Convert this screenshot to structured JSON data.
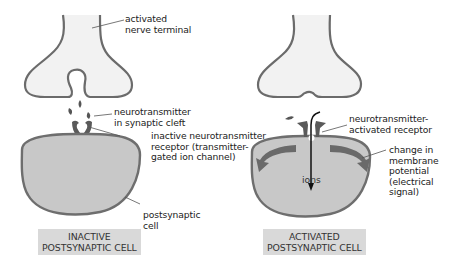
{
  "diagram": {
    "colors": {
      "terminal_fill": "#f2f2f2",
      "terminal_outline": "#6b6b6b",
      "cell_fill": "#c8c8c8",
      "membrane": "#6e6e6e",
      "neurotransmitter": "#555555",
      "receptor": "#5a5a5a",
      "arrow_dark": "#6a6a6a",
      "ion_arrow": "#111111",
      "caption_bg": "#d9d9d9",
      "leader_line": "#555555"
    },
    "left_panel": {
      "state": "inactive",
      "labels": {
        "nerve_terminal": "activated\nnerve terminal",
        "neurotransmitter": "neurotransmitter\nin synaptic cleft",
        "receptor": "inactive neurotransmitter\nreceptor (transmitter-\ngated ion channel)",
        "cell": "postsynaptic\ncell"
      },
      "caption": "INACTIVE\nPOSTSYNAPTIC CELL"
    },
    "right_panel": {
      "state": "activated",
      "labels": {
        "receptor": "neurotransmitter-\nactivated receptor",
        "ions": "ions",
        "membrane_change": "change in\nmembrane\npotential\n(electrical\nsignal)"
      },
      "caption": "ACTIVATED\nPOSTSYNAPTIC CELL"
    }
  }
}
